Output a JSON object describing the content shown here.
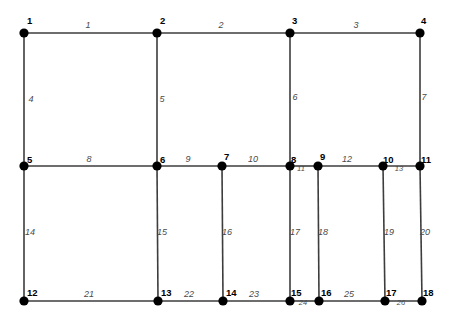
{
  "figure": {
    "type": "structural-truss-grid-diagram",
    "width": 456,
    "height": 324,
    "background_color": "#ffffff",
    "line_color": "#3d3d3d",
    "joint_color": "#000000",
    "node_label_color": "#000000",
    "member_label_color": "#4a4a4a"
  },
  "nodes": [
    {
      "id": "1",
      "label": "1",
      "x": 24,
      "y": 33,
      "lx": 27,
      "ly": 24
    },
    {
      "id": "2",
      "label": "2",
      "x": 157,
      "y": 33,
      "lx": 160,
      "ly": 24
    },
    {
      "id": "3",
      "label": "3",
      "x": 290,
      "y": 33,
      "lx": 292,
      "ly": 24
    },
    {
      "id": "4",
      "label": "4",
      "x": 420,
      "y": 33,
      "lx": 421,
      "ly": 24
    },
    {
      "id": "5",
      "label": "5",
      "x": 24,
      "y": 166,
      "lx": 27,
      "ly": 163
    },
    {
      "id": "6",
      "label": "6",
      "x": 157,
      "y": 166,
      "lx": 160,
      "ly": 163
    },
    {
      "id": "7",
      "label": "7",
      "x": 222,
      "y": 166,
      "lx": 224,
      "ly": 160
    },
    {
      "id": "8",
      "label": "8",
      "x": 290,
      "y": 166,
      "lx": 291,
      "ly": 163
    },
    {
      "id": "9",
      "label": "9",
      "x": 318,
      "y": 166,
      "lx": 320,
      "ly": 160
    },
    {
      "id": "10",
      "label": "10",
      "x": 383,
      "y": 166,
      "lx": 383,
      "ly": 163
    },
    {
      "id": "11",
      "label": "11",
      "x": 420,
      "y": 166,
      "lx": 421,
      "ly": 163
    },
    {
      "id": "12",
      "label": "12",
      "x": 24,
      "y": 301,
      "lx": 27,
      "ly": 296
    },
    {
      "id": "13",
      "label": "13",
      "x": 158,
      "y": 301,
      "lx": 161,
      "ly": 296
    },
    {
      "id": "14",
      "label": "14",
      "x": 223,
      "y": 301,
      "lx": 226,
      "ly": 296
    },
    {
      "id": "15",
      "label": "15",
      "x": 290,
      "y": 301,
      "lx": 291,
      "ly": 296
    },
    {
      "id": "16",
      "label": "16",
      "x": 319,
      "y": 301,
      "lx": 321,
      "ly": 296
    },
    {
      "id": "17",
      "label": "17",
      "x": 385,
      "y": 301,
      "lx": 386,
      "ly": 296
    },
    {
      "id": "18",
      "label": "18",
      "x": 422,
      "y": 301,
      "lx": 423,
      "ly": 296
    }
  ],
  "members": [
    {
      "id": "1",
      "label": "1",
      "from": "1",
      "to": "2",
      "orientation": "horizontal",
      "lx": 88,
      "ly": 28,
      "size": "normal"
    },
    {
      "id": "2",
      "label": "2",
      "from": "2",
      "to": "3",
      "orientation": "horizontal",
      "lx": 221,
      "ly": 28,
      "size": "normal"
    },
    {
      "id": "3",
      "label": "3",
      "from": "3",
      "to": "4",
      "orientation": "horizontal",
      "lx": 356,
      "ly": 28,
      "size": "normal"
    },
    {
      "id": "4",
      "label": "4",
      "from": "1",
      "to": "5",
      "orientation": "vertical",
      "lx": 31,
      "ly": 102,
      "size": "normal"
    },
    {
      "id": "5",
      "label": "5",
      "from": "2",
      "to": "6",
      "orientation": "vertical",
      "lx": 162,
      "ly": 102,
      "size": "normal"
    },
    {
      "id": "6",
      "label": "6",
      "from": "3",
      "to": "8",
      "orientation": "vertical",
      "lx": 295,
      "ly": 100,
      "size": "normal"
    },
    {
      "id": "7",
      "label": "7",
      "from": "4",
      "to": "11",
      "orientation": "vertical",
      "lx": 424,
      "ly": 100,
      "size": "normal"
    },
    {
      "id": "8",
      "label": "8",
      "from": "5",
      "to": "6",
      "orientation": "horizontal",
      "lx": 89,
      "ly": 162,
      "size": "normal"
    },
    {
      "id": "9",
      "label": "9",
      "from": "6",
      "to": "7",
      "orientation": "horizontal",
      "lx": 188,
      "ly": 162,
      "size": "normal"
    },
    {
      "id": "10",
      "label": "10",
      "from": "7",
      "to": "8",
      "orientation": "horizontal",
      "lx": 253,
      "ly": 162,
      "size": "normal"
    },
    {
      "id": "11",
      "label": "11",
      "from": "8",
      "to": "9",
      "orientation": "horizontal",
      "lx": 301,
      "ly": 171,
      "size": "small"
    },
    {
      "id": "12",
      "label": "12",
      "from": "9",
      "to": "10",
      "orientation": "horizontal",
      "lx": 347,
      "ly": 162,
      "size": "normal"
    },
    {
      "id": "13",
      "label": "13",
      "from": "10",
      "to": "11",
      "orientation": "horizontal",
      "lx": 399,
      "ly": 171,
      "size": "small"
    },
    {
      "id": "14",
      "label": "14",
      "from": "5",
      "to": "12",
      "orientation": "vertical",
      "lx": 30,
      "ly": 235,
      "size": "normal"
    },
    {
      "id": "15",
      "label": "15",
      "from": "6",
      "to": "13",
      "orientation": "vertical",
      "lx": 162,
      "ly": 235,
      "size": "normal"
    },
    {
      "id": "16",
      "label": "16",
      "from": "7",
      "to": "14",
      "orientation": "vertical",
      "lx": 227,
      "ly": 235,
      "size": "normal"
    },
    {
      "id": "17",
      "label": "17",
      "from": "8",
      "to": "15",
      "orientation": "vertical",
      "lx": 295,
      "ly": 235,
      "size": "normal"
    },
    {
      "id": "18",
      "label": "18",
      "from": "9",
      "to": "16",
      "orientation": "vertical",
      "lx": 323,
      "ly": 235,
      "size": "normal"
    },
    {
      "id": "19",
      "label": "19",
      "from": "10",
      "to": "17",
      "orientation": "vertical",
      "lx": 389,
      "ly": 235,
      "size": "normal"
    },
    {
      "id": "20",
      "label": "20",
      "from": "11",
      "to": "18",
      "orientation": "vertical",
      "lx": 425,
      "ly": 235,
      "size": "normal"
    },
    {
      "id": "21",
      "label": "21",
      "from": "12",
      "to": "13",
      "orientation": "horizontal",
      "lx": 89,
      "ly": 297,
      "size": "normal"
    },
    {
      "id": "22",
      "label": "22",
      "from": "13",
      "to": "14",
      "orientation": "horizontal",
      "lx": 189,
      "ly": 297,
      "size": "normal"
    },
    {
      "id": "23",
      "label": "23",
      "from": "14",
      "to": "15",
      "orientation": "horizontal",
      "lx": 254,
      "ly": 297,
      "size": "normal"
    },
    {
      "id": "24",
      "label": "24",
      "from": "15",
      "to": "16",
      "orientation": "horizontal",
      "lx": 303,
      "ly": 305,
      "size": "small"
    },
    {
      "id": "25",
      "label": "25",
      "from": "16",
      "to": "17",
      "orientation": "horizontal",
      "lx": 349,
      "ly": 297,
      "size": "normal"
    },
    {
      "id": "26",
      "label": "26",
      "from": "17",
      "to": "18",
      "orientation": "horizontal",
      "lx": 401,
      "ly": 305,
      "size": "small"
    }
  ],
  "geometry": {
    "joint_radius": 4.6,
    "line_width": 1.6
  }
}
